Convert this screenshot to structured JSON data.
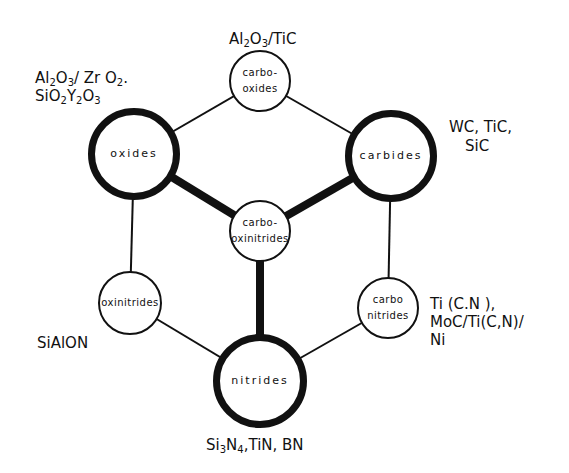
{
  "diagram": {
    "title": "",
    "colors": {
      "stroke": "#111111",
      "background": "#ffffff"
    },
    "nodes": [
      {
        "id": "carbo-oxides",
        "label_lines": [
          "carbo-",
          "oxides"
        ],
        "cx": 260,
        "cy": 81,
        "r": 31,
        "emphasis": "thin"
      },
      {
        "id": "oxides",
        "label_lines": [
          "oxides"
        ],
        "cx": 134,
        "cy": 154,
        "r": 46,
        "emphasis": "thick"
      },
      {
        "id": "carbides",
        "label_lines": [
          "carbides"
        ],
        "cx": 391,
        "cy": 156,
        "r": 46,
        "emphasis": "thick"
      },
      {
        "id": "carbo-oxinitrides",
        "label_lines": [
          "carbo-",
          "oxinitrides"
        ],
        "cx": 260,
        "cy": 231,
        "r": 31,
        "emphasis": "thin"
      },
      {
        "id": "oxinitrides",
        "label_lines": [
          "oxinitrides"
        ],
        "cx": 130,
        "cy": 303,
        "r": 32,
        "emphasis": "thin"
      },
      {
        "id": "carbonitrides",
        "label_lines": [
          "carbo",
          "nitrides"
        ],
        "cx": 388,
        "cy": 308,
        "r": 31,
        "emphasis": "thin"
      },
      {
        "id": "nitrides",
        "label_lines": [
          "nitrides"
        ],
        "cx": 260,
        "cy": 381,
        "r": 47,
        "emphasis": "thick"
      }
    ],
    "edges": [
      {
        "from": "oxides",
        "to": "carbo-oxides",
        "weight": "thin"
      },
      {
        "from": "carbo-oxides",
        "to": "carbides",
        "weight": "thin"
      },
      {
        "from": "oxides",
        "to": "oxinitrides",
        "weight": "thin"
      },
      {
        "from": "carbides",
        "to": "carbonitrides",
        "weight": "thin"
      },
      {
        "from": "oxinitrides",
        "to": "nitrides",
        "weight": "thin"
      },
      {
        "from": "carbonitrides",
        "to": "nitrides",
        "weight": "thin"
      },
      {
        "from": "oxides",
        "to": "carbo-oxinitrides",
        "weight": "thick"
      },
      {
        "from": "carbides",
        "to": "carbo-oxinitrides",
        "weight": "thick"
      },
      {
        "from": "nitrides",
        "to": "carbo-oxinitrides",
        "weight": "thick"
      }
    ],
    "annotations": {
      "carbo_oxides": {
        "parts": [
          [
            "Al",
            ""
          ],
          [
            "2",
            "sub"
          ],
          [
            "O",
            ""
          ],
          [
            "3",
            "sub"
          ],
          [
            "/TiC",
            ""
          ]
        ]
      },
      "oxides_line1": {
        "parts": [
          [
            "Al",
            ""
          ],
          [
            "2",
            "sub"
          ],
          [
            "O",
            ""
          ],
          [
            "3",
            "sub"
          ],
          [
            "/ Zr O",
            ""
          ],
          [
            "2",
            "sub"
          ],
          [
            ".",
            ""
          ]
        ]
      },
      "oxides_line2": {
        "parts": [
          [
            "SiO",
            ""
          ],
          [
            "2",
            "sub"
          ],
          [
            "Y",
            ""
          ],
          [
            "2",
            "sub"
          ],
          [
            "O",
            ""
          ],
          [
            "3",
            "sub"
          ]
        ]
      },
      "carbides_line1": "WC, TiC,",
      "carbides_line2": "SiC",
      "oxinitrides": "SiAlON",
      "carbonitrides_line1": "Ti (C.N ),",
      "carbonitrides_line2": "MoC/Ti(C,N)/",
      "carbonitrides_line3": "Ni",
      "nitrides": {
        "parts": [
          [
            "Si",
            ""
          ],
          [
            "3",
            "sub"
          ],
          [
            "N",
            ""
          ],
          [
            "4",
            "sub"
          ],
          [
            ",TiN, BN",
            ""
          ]
        ]
      }
    }
  }
}
